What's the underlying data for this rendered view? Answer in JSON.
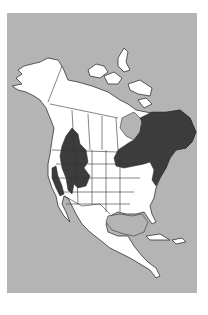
{
  "map": {
    "subject": "North America range map",
    "colors": {
      "background": "#b4b4b4",
      "land": "#ffffff",
      "range": "#3c3c3c",
      "outline": "#333333"
    },
    "regions": {
      "range_east": "Eastern Canada & northeastern United States",
      "range_west": "Interior western North America",
      "range_coast": "Pacific coast (California)"
    }
  }
}
